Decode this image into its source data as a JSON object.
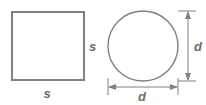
{
  "figure": {
    "background_color": "#ffffff",
    "stroke_color": "#808080",
    "label_color": "#6e6e6e",
    "shapes": {
      "square": {
        "name": "square",
        "x": 11,
        "y": 11,
        "width": 73,
        "height": 69,
        "stroke_width": 2
      },
      "circle": {
        "name": "circle",
        "cx": 143,
        "cy": 46,
        "r": 35,
        "stroke_width": 1.4
      }
    },
    "labels": {
      "square_side_right": "s",
      "square_side_bottom": "s",
      "circle_diameter_vertical": "d",
      "circle_diameter_horizontal": "d"
    },
    "dimensions": {
      "vertical": {
        "axis_x": 188,
        "y_start": 11,
        "y_end": 81,
        "label_x": 195,
        "label_y": 51
      },
      "horizontal": {
        "axis_y": 87,
        "x_start": 108,
        "x_end": 178,
        "label_x": 142,
        "label_y": 101
      }
    }
  }
}
